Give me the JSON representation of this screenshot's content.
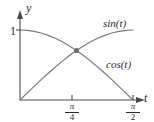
{
  "chart_data": {
    "type": "line",
    "title": "",
    "xlabel": "t",
    "ylabel": "y",
    "xlim": [
      0,
      1.5707963
    ],
    "ylim": [
      0,
      1.08
    ],
    "grid": false,
    "legend_position": "inline-end-of-curve",
    "x_tick_labels": [
      "π/4",
      "π/2"
    ],
    "x_tick_values": [
      0.7853982,
      1.5707963
    ],
    "y_tick_labels": [
      "1"
    ],
    "y_tick_values": [
      1
    ],
    "annotations": [
      {
        "name": "intersection-point",
        "label": "",
        "x": 0.7853982,
        "y": 0.7071068,
        "marker": "filled-circle"
      }
    ],
    "series": [
      {
        "name": "sin(t)",
        "label": "sin(t)",
        "color": "#7a7a7a",
        "x": [
          0,
          0.0981748,
          0.1963495,
          0.2945243,
          0.3926991,
          0.4908739,
          0.5890486,
          0.6872234,
          0.7853982,
          0.8835729,
          0.9817477,
          1.0799225,
          1.1780972,
          1.276272,
          1.3744468,
          1.4726216,
          1.5707963
        ],
        "y": [
          0,
          0.0980171,
          0.1950903,
          0.2902847,
          0.3826834,
          0.4713967,
          0.5555702,
          0.6343933,
          0.7071068,
          0.7730104,
          0.8314696,
          0.8819213,
          0.9238795,
          0.9569403,
          0.9807853,
          0.9951847,
          1
        ]
      },
      {
        "name": "cos(t)",
        "label": "cos(t)",
        "color": "#7a7a7a",
        "x": [
          0,
          0.0981748,
          0.1963495,
          0.2945243,
          0.3926991,
          0.4908739,
          0.5890486,
          0.6872234,
          0.7853982,
          0.8835729,
          0.9817477,
          1.0799225,
          1.1780972,
          1.276272,
          1.3744468,
          1.4726216,
          1.5707963
        ],
        "y": [
          1,
          0.9951847,
          0.9807853,
          0.9569403,
          0.9238795,
          0.8819213,
          0.8314696,
          0.7730104,
          0.7071068,
          0.6343933,
          0.5555702,
          0.4713967,
          0.3826834,
          0.2902847,
          0.1950903,
          0.0980171,
          0
        ]
      }
    ],
    "colors": {
      "axis": "#4a4a4a",
      "curve": "#7a7a7a",
      "text": "#2b2b2b",
      "marker": "#6e6e6e",
      "background": "#ffffff"
    }
  },
  "labels": {
    "y_axis": "y",
    "x_axis": "t",
    "y_tick_one": "1",
    "sin_series": "sin(t)",
    "cos_series": "cos(t)",
    "pi_symbol": "π",
    "denominator_four": "4",
    "denominator_two": "2"
  }
}
